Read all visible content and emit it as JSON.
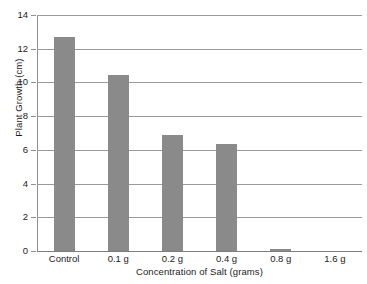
{
  "chart_data": {
    "type": "bar",
    "title": "",
    "subtitle": "",
    "xlabel": "Concentration of Salt (grams)",
    "ylabel": "Plant Growth (cm)",
    "categories": [
      "Control",
      "0.1 g",
      "0.2 g",
      "0.4 g",
      "0.8 g",
      "1.6 g"
    ],
    "values": [
      12.7,
      10.45,
      6.9,
      6.35,
      0.1,
      0
    ],
    "ylim": [
      0,
      14
    ],
    "ytick_labels": [
      "0",
      "2",
      "4",
      "6",
      "8",
      "10",
      "12",
      "14"
    ],
    "ytick_values": [
      0,
      2,
      4,
      6,
      8,
      10,
      12,
      14
    ],
    "grid": true,
    "grid_axis": "y",
    "legend": false,
    "legend_position": "none",
    "annotations": [],
    "colors": {
      "bar": "#8a8a8a",
      "gridline": "#9a9a9a",
      "axis": "#8f8f8f",
      "text": "#1c1c1c",
      "background": "#ffffff"
    }
  }
}
